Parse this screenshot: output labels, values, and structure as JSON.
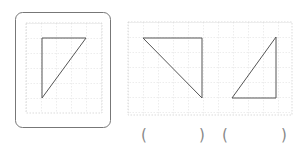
{
  "figure": {
    "reference_panel": {
      "frame": {
        "x": 15,
        "y": 12,
        "w": 95,
        "h": 115,
        "rx": 7,
        "stroke": "#777777"
      },
      "grid": {
        "x": 26,
        "y": 23,
        "w": 76,
        "h": 90,
        "step": 15,
        "color": "#cccccc"
      },
      "triangle": {
        "points": "42,38 86,38 42,98",
        "stroke": "#555555"
      }
    },
    "options_panel": {
      "grid": {
        "x": 128,
        "y": 22,
        "w": 164,
        "h": 93,
        "step": 15,
        "color": "#cccccc"
      },
      "triangles": [
        {
          "name": "option-a",
          "points": "143,38 202,38 202,98",
          "stroke": "#555555"
        },
        {
          "name": "option-b",
          "points": "232,98 276,98 276,37",
          "stroke": "#555555"
        }
      ]
    },
    "answer_blanks": [
      {
        "open": "(",
        "close": ")",
        "open_x": 141,
        "close_x": 199
      },
      {
        "open": "(",
        "close": ")",
        "open_x": 222,
        "close_x": 281
      }
    ]
  }
}
